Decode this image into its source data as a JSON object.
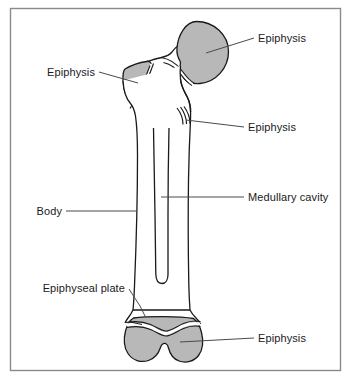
{
  "figure": {
    "frame": {
      "border_color": "#8a8a8a",
      "background_color": "#ffffff"
    },
    "colors": {
      "bone_outline": "#1a1a1a",
      "bone_fill": "#ffffff",
      "epiphysis_fill": "#b8b8b8",
      "leader_line": "#4a4a4a",
      "label_text": "#1a1a1a"
    },
    "labels": [
      {
        "id": "epiphysis-head",
        "text": "Epiphysis",
        "anchor": "start",
        "x": 258,
        "y": 42,
        "part": "femoral-head"
      },
      {
        "id": "epiphysis-greater-trochanter",
        "text": "Epiphysis",
        "anchor": "end",
        "x": 95,
        "y": 76,
        "part": "greater-trochanter"
      },
      {
        "id": "epiphysis-lesser-trochanter",
        "text": "Epiphysis",
        "anchor": "start",
        "x": 248,
        "y": 131,
        "part": "lesser-trochanter"
      },
      {
        "id": "medullary-cavity",
        "text": "Medullary cavity",
        "anchor": "start",
        "x": 248,
        "y": 201,
        "part": "marrow-canal"
      },
      {
        "id": "body",
        "text": "Body",
        "anchor": "end",
        "x": 62,
        "y": 215,
        "part": "diaphysis"
      },
      {
        "id": "epiphyseal-plate",
        "text": "Epiphyseal plate",
        "anchor": "end",
        "x": 125,
        "y": 292,
        "part": "growth-plate-distal"
      },
      {
        "id": "epiphysis-distal",
        "text": "Epiphysis",
        "anchor": "start",
        "x": 258,
        "y": 342,
        "part": "distal-condyles"
      }
    ],
    "parts": [
      {
        "id": "femoral-head",
        "name": "Epiphysis (head of femur)",
        "shaded": true
      },
      {
        "id": "greater-trochanter",
        "name": "Epiphysis (greater trochanter)",
        "shaded": true
      },
      {
        "id": "lesser-trochanter",
        "name": "Epiphysis (lesser trochanter)",
        "shaded": false
      },
      {
        "id": "diaphysis",
        "name": "Body (shaft)",
        "shaded": false
      },
      {
        "id": "marrow-canal",
        "name": "Medullary cavity",
        "shaded": false
      },
      {
        "id": "growth-plate-distal",
        "name": "Epiphyseal plate",
        "shaded": false
      },
      {
        "id": "distal-condyles",
        "name": "Epiphysis (distal condyles)",
        "shaded": true
      }
    ]
  }
}
